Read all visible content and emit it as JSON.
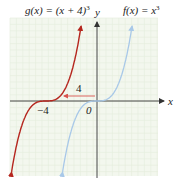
{
  "chart_data": {
    "type": "line",
    "title": "",
    "xlabel": "x",
    "ylabel": "y",
    "grid": true,
    "series": [
      {
        "name": "g(x) = (x + 4)^3",
        "label": "g(x) = (x + 4)³",
        "color": "#b5261e",
        "shift": -4,
        "points": [
          [
            -6,
            -8
          ],
          [
            -5,
            -1
          ],
          [
            -4,
            0
          ],
          [
            -3,
            1
          ],
          [
            -2,
            8
          ]
        ]
      },
      {
        "name": "f(x) = x^3",
        "label": "f(x) = x³",
        "color": "#a8c8e8",
        "shift": 0,
        "points": [
          [
            -2,
            -8
          ],
          [
            -1,
            -1
          ],
          [
            0,
            0
          ],
          [
            1,
            1
          ],
          [
            2,
            8
          ]
        ]
      }
    ],
    "annotations": [
      {
        "text": "4",
        "type": "horizontal-arrow",
        "from": [
          0,
          0.9
        ],
        "to": [
          -4,
          0.9
        ],
        "color": "#d9534f"
      },
      {
        "text": "-4",
        "type": "tick-label",
        "at": -4
      },
      {
        "text": "0",
        "type": "origin-label",
        "at": 0
      }
    ],
    "xlim": [
      -7,
      4.5
    ],
    "ylim": [
      -20,
      22
    ]
  },
  "labels": {
    "g_label": "g(x) = (x + 4)",
    "g_exp": "3",
    "f_label": "f(x) = x",
    "f_exp": "3",
    "y_axis": "y",
    "x_axis": "x",
    "shift_amount": "4",
    "tick_neg4": "−4",
    "origin": "0"
  },
  "colors": {
    "grid_bg": "#f3f7ee",
    "grid_line": "#e4ecdc",
    "axis": "#333333",
    "g_curve": "#b5261e",
    "f_curve": "#a8c8e8",
    "shift_arrow": "#d9534f"
  }
}
